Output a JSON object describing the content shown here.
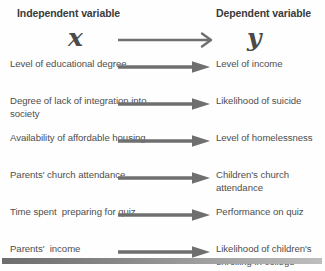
{
  "diagram": {
    "headers": {
      "left": "Independent variable",
      "right": "Dependent variable"
    },
    "symbols": {
      "left": "x",
      "right": "y",
      "arrow": "main-arrow-right"
    },
    "arrow_icon_name": "arrow-right-icon",
    "colors": {
      "text": "#4e4e4e",
      "heading": "#3a3a3a",
      "arrow": "#6f6f6f",
      "bar_start": "#6d6d6d",
      "bar_end": "#bdbdbd",
      "background": "#ffffff"
    },
    "rows": [
      {
        "independent": "Level of educational degree",
        "dependent": "Level of income"
      },
      {
        "independent": "Degree of lack of integration into society",
        "dependent": "Likelihood of suicide"
      },
      {
        "independent": "Availability of affordable housing",
        "dependent": "Level of homelessness"
      },
      {
        "independent": "Parents' church attendance",
        "dependent": "Children's church attendance"
      },
      {
        "independent": "Time spent  preparing for quiz",
        "dependent": "Performance on quiz"
      },
      {
        "independent": "Parents'  income",
        "dependent": "Likelihood of children's enrolling in college"
      }
    ]
  }
}
